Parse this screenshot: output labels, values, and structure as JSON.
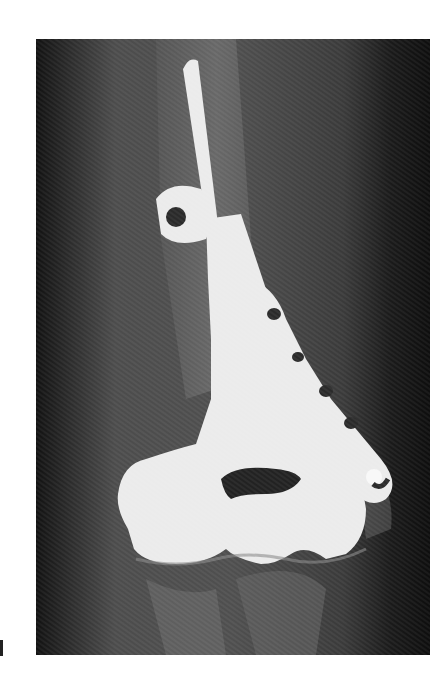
{
  "image": {
    "kind": "radiograph",
    "subject": "elbow with distal humerus implant (plate and stemmed condylar component)",
    "colors": {
      "background": "#ffffff",
      "film_dark": "#151515",
      "soft_tissue": "#4a4a4a",
      "bone": "#7a7a7a",
      "implant": "#ebebeb"
    }
  }
}
